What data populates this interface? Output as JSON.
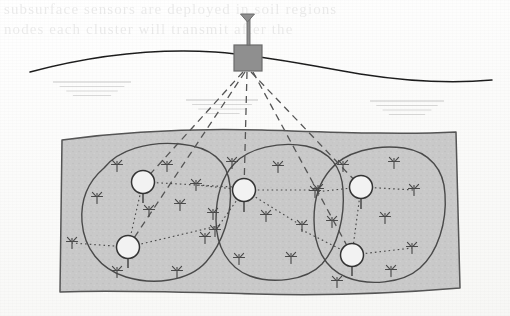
{
  "figure": {
    "name": "underground-wireless-sensor-network",
    "caption": "",
    "background_color": "#fdfdfc"
  },
  "ghost_text": {
    "line1": "subsurface  sensors  are  deployed  in  soil  regions",
    "line2": "nodes  each  cluster  will  transmit  after  the"
  },
  "colors": {
    "soil_fill": "#c9c9c9",
    "soil_stroke": "#555555",
    "cluster_stroke": "#4a4a4a",
    "node_stroke": "#4a4a4a",
    "cluster_head_fill": "#f2f2f2",
    "cluster_head_stroke": "#333333",
    "base_station_fill": "#8f8f8f",
    "base_station_stroke": "#6b6b6b",
    "ground_line": "#1f1f1f",
    "uplink_dash": "#555555",
    "intralink_dot": "#4a4a4a",
    "ghost_mark": "#8a8a8a"
  },
  "ground": {
    "label": "ground-surface",
    "path": "M 30 72 C 90 56, 150 48, 215 52 C 270 56, 310 66, 360 74 C 405 81, 450 84, 492 80"
  },
  "base_station": {
    "label": "base-station",
    "box": {
      "x": 234,
      "y": 45,
      "width": 28,
      "height": 26
    },
    "mast": {
      "x": 247,
      "y_top": 18,
      "y_bottom": 45,
      "width": 3
    },
    "dish": {
      "cx": 247.5,
      "cy": 18,
      "half_width": 7,
      "height": 8
    }
  },
  "soil_block": {
    "label": "soil-region",
    "path": "M 62 140 C 120 132, 190 128, 262 130 C 330 132, 400 135, 456 132 L 460 288 C 400 293, 330 296, 255 294 C 180 292, 115 290, 60 292 Z"
  },
  "uplinks": [
    {
      "id": "uplink-ch-1-1",
      "from": "base-station",
      "to": "ch-1-1",
      "x1": 243,
      "y1": 72,
      "x2": 143,
      "y2": 182
    },
    {
      "id": "uplink-ch-1-2",
      "from": "base-station",
      "to": "ch-1-2",
      "x1": 245,
      "y1": 72,
      "x2": 128,
      "y2": 247
    },
    {
      "id": "uplink-ch-2-1",
      "from": "base-station",
      "to": "ch-2-1",
      "x1": 247,
      "y1": 72,
      "x2": 244,
      "y2": 190
    },
    {
      "id": "uplink-ch-3-1",
      "from": "base-station",
      "to": "ch-3-1",
      "x1": 251,
      "y1": 72,
      "x2": 361,
      "y2": 187
    },
    {
      "id": "uplink-ch-3-2",
      "from": "base-station",
      "to": "ch-3-2",
      "x1": 253,
      "y1": 72,
      "x2": 352,
      "y2": 255
    }
  ],
  "clusters": [
    {
      "id": "cluster-1",
      "label": "cluster-left",
      "outline": "M 104 168 C 118 150, 148 141, 180 144 C 212 147, 228 162, 230 186 C 233 214, 222 244, 206 262 C 188 282, 152 285, 126 277 C 100 269, 84 248, 82 222 C 80 196, 90 180, 104 168 Z",
      "heads": [
        {
          "id": "ch-1-1",
          "cx": 143,
          "cy": 182,
          "r": 11.5,
          "stem_to_y": 203
        },
        {
          "id": "ch-1-2",
          "cx": 128,
          "cy": 247,
          "r": 11.5,
          "stem_to_y": 268
        }
      ],
      "intra_links": [
        {
          "x1": 143,
          "y1": 182,
          "x2": 128,
          "y2": 247
        },
        {
          "x1": 143,
          "y1": 182,
          "x2": 233,
          "y2": 187
        },
        {
          "x1": 128,
          "y1": 247,
          "x2": 222,
          "y2": 225
        },
        {
          "x1": 128,
          "y1": 247,
          "x2": 72,
          "y2": 243
        }
      ],
      "nodes": [
        {
          "cx": 117,
          "cy": 166
        },
        {
          "cx": 167,
          "cy": 166
        },
        {
          "cx": 97,
          "cy": 198
        },
        {
          "cx": 149,
          "cy": 211
        },
        {
          "cx": 180,
          "cy": 205
        },
        {
          "cx": 72,
          "cy": 243
        },
        {
          "cx": 205,
          "cy": 238
        },
        {
          "cx": 117,
          "cy": 272
        },
        {
          "cx": 177,
          "cy": 272
        },
        {
          "cx": 213,
          "cy": 214
        }
      ]
    },
    {
      "id": "cluster-2",
      "label": "cluster-middle",
      "outline": "M 234 164 C 248 148, 280 141, 306 146 C 330 151, 342 168, 343 190 C 345 216, 338 246, 322 264 C 306 281, 272 284, 250 276 C 228 268, 216 246, 216 220 C 216 194, 222 177, 234 164 Z",
      "heads": [
        {
          "id": "ch-2-1",
          "cx": 244,
          "cy": 190,
          "r": 11.5,
          "stem_to_y": 212
        }
      ],
      "intra_links": [
        {
          "x1": 244,
          "y1": 190,
          "x2": 318,
          "y2": 190
        },
        {
          "x1": 244,
          "y1": 190,
          "x2": 196,
          "y2": 185
        },
        {
          "x1": 244,
          "y1": 190,
          "x2": 215,
          "y2": 231
        },
        {
          "x1": 244,
          "y1": 190,
          "x2": 302,
          "y2": 226
        }
      ],
      "nodes": [
        {
          "cx": 232,
          "cy": 163
        },
        {
          "cx": 278,
          "cy": 167
        },
        {
          "cx": 196,
          "cy": 185
        },
        {
          "cx": 318,
          "cy": 190
        },
        {
          "cx": 215,
          "cy": 231
        },
        {
          "cx": 266,
          "cy": 216
        },
        {
          "cx": 302,
          "cy": 226
        },
        {
          "cx": 239,
          "cy": 259
        },
        {
          "cx": 291,
          "cy": 258
        }
      ]
    },
    {
      "id": "cluster-3",
      "label": "cluster-right",
      "outline": "M 330 170 C 344 152, 376 144, 404 148 C 430 152, 444 170, 445 194 C 447 222, 438 252, 420 268 C 402 284, 368 286, 346 277 C 324 268, 314 246, 314 220 C 314 196, 320 182, 330 170 Z",
      "heads": [
        {
          "id": "ch-3-1",
          "cx": 361,
          "cy": 187,
          "r": 11.5,
          "stem_to_y": 209
        },
        {
          "id": "ch-3-2",
          "cx": 352,
          "cy": 255,
          "r": 11.5,
          "stem_to_y": 276
        }
      ],
      "intra_links": [
        {
          "x1": 361,
          "y1": 187,
          "x2": 352,
          "y2": 255
        },
        {
          "x1": 361,
          "y1": 187,
          "x2": 414,
          "y2": 190
        },
        {
          "x1": 361,
          "y1": 187,
          "x2": 315,
          "y2": 192
        },
        {
          "x1": 352,
          "y1": 255,
          "x2": 412,
          "y2": 248
        },
        {
          "x1": 352,
          "y1": 255,
          "x2": 300,
          "y2": 229
        }
      ],
      "nodes": [
        {
          "cx": 343,
          "cy": 166
        },
        {
          "cx": 394,
          "cy": 163
        },
        {
          "cx": 315,
          "cy": 192
        },
        {
          "cx": 414,
          "cy": 190
        },
        {
          "cx": 332,
          "cy": 222
        },
        {
          "cx": 385,
          "cy": 218
        },
        {
          "cx": 412,
          "cy": 248
        },
        {
          "cx": 337,
          "cy": 282
        },
        {
          "cx": 391,
          "cy": 271
        }
      ]
    }
  ],
  "ghost_marks": [
    {
      "id": "ghost-mark-left",
      "cx": 92,
      "cy": 82,
      "width": 78,
      "lines": 4
    },
    {
      "id": "ghost-mark-center",
      "cx": 222,
      "cy": 100,
      "width": 72,
      "lines": 4
    },
    {
      "id": "ghost-mark-right",
      "cx": 407,
      "cy": 101,
      "width": 74,
      "lines": 4
    }
  ]
}
